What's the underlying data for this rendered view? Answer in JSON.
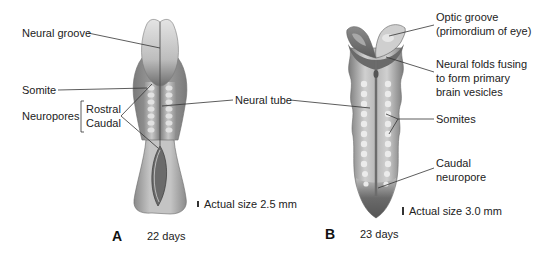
{
  "figure": {
    "panels": [
      {
        "id": "A",
        "letter": "A",
        "age": "22 days",
        "scale_text": "Actual size 2.5 mm",
        "scale_bar_height_px": 6
      },
      {
        "id": "B",
        "letter": "B",
        "age": "23 days",
        "scale_text": "Actual size 3.0 mm",
        "scale_bar_height_px": 8
      }
    ],
    "labels_left": {
      "neural_groove": "Neural groove",
      "somite": "Somite",
      "neuropores": "Neuropores",
      "rostral": "Rostral",
      "caudal": "Caudal"
    },
    "label_center": {
      "neural_tube": "Neural tube"
    },
    "labels_right": {
      "optic_groove_line1": "Optic groove",
      "optic_groove_line2": "(primordium of eye)",
      "neural_folds_line1": "Neural folds fusing",
      "neural_folds_line2": "to form primary",
      "neural_folds_line3": "brain vesicles",
      "somites": "Somites",
      "caudal_neuropore_line1": "Caudal",
      "caudal_neuropore_line2": "neuropore"
    },
    "colors": {
      "embryo_light": "#d8d8d8",
      "embryo_mid": "#9a9a9a",
      "embryo_dark": "#5e5e5e",
      "leader_line": "#333333",
      "text": "#222222"
    }
  }
}
